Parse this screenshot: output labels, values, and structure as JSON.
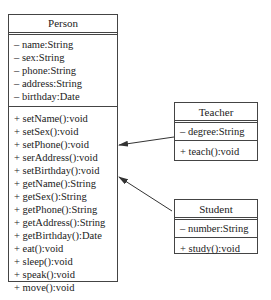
{
  "classes": {
    "person": {
      "name": "Person",
      "attributes": [
        "– name:String",
        "– sex:String",
        "– phone:String",
        "– address:String",
        "– birthday:Date"
      ],
      "methods": [
        "+ setName():void",
        "+ setSex():void",
        "+ setPhone():void",
        "+ serAddress():void",
        "+ setBirthday():void",
        "+ getName():String",
        "+ getSex():String",
        "+ getPhone():String",
        "+ getAddress():String",
        "+ getBirthday():Date",
        "+ eat():void",
        "+ sleep():void",
        "+ speak():void",
        "+ move():void"
      ]
    },
    "teacher": {
      "name": "Teacher",
      "attributes": [
        "– degree:String"
      ],
      "methods": [
        "+ teach():void"
      ]
    },
    "student": {
      "name": "Student",
      "attributes": [
        "– number:String"
      ],
      "methods": [
        "+ study():void"
      ]
    }
  },
  "relations": [
    {
      "from": "teacher",
      "to": "person",
      "type": "arrow"
    },
    {
      "from": "student",
      "to": "person",
      "type": "arrow"
    }
  ],
  "colors": {
    "line": "#444444",
    "background": "#ffffff"
  }
}
